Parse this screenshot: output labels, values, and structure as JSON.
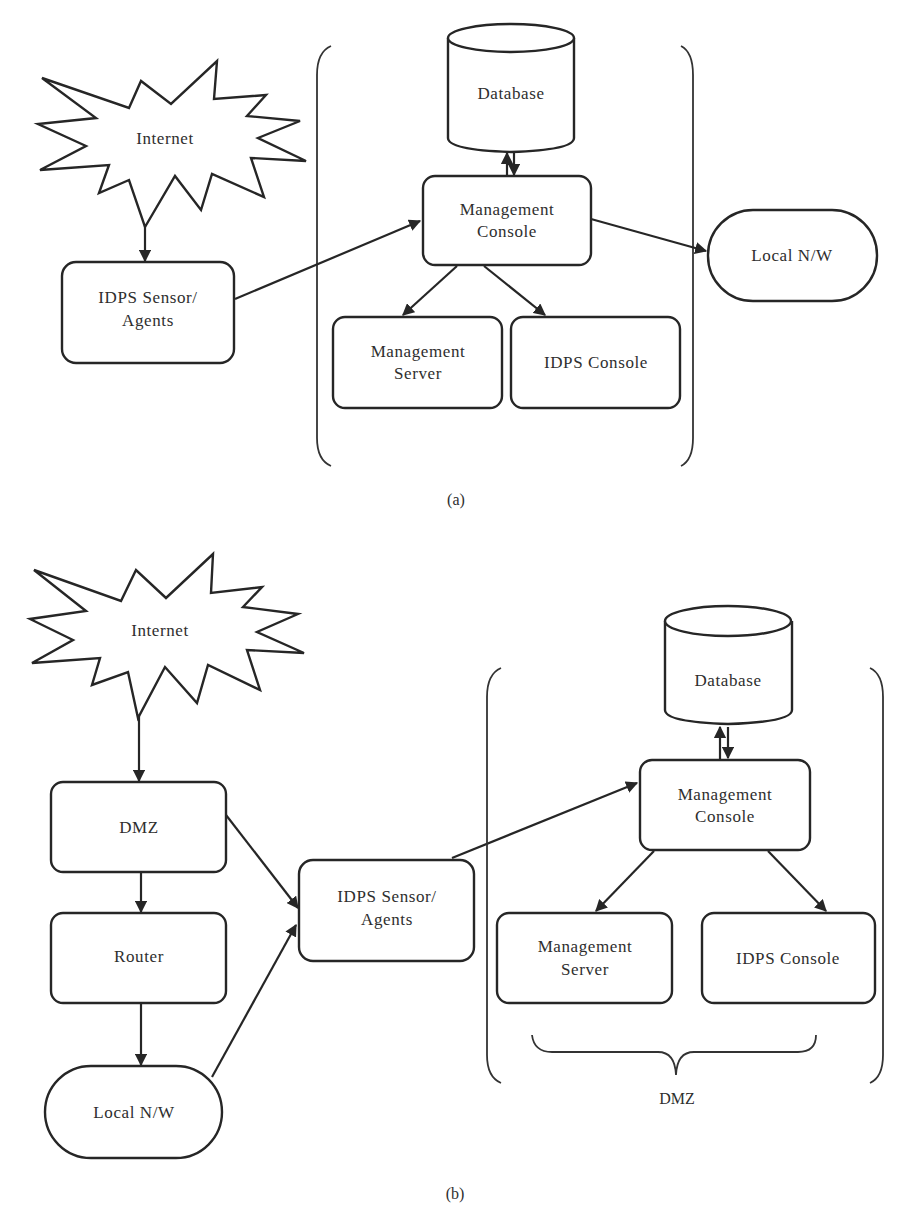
{
  "panels": {
    "a": {
      "caption": "(a)",
      "nodes": {
        "internet": "Internet",
        "sensor_line1": "IDPS Sensor/",
        "sensor_line2": "Agents",
        "database": "Database",
        "mgmt_console_line1": "Management",
        "mgmt_console_line2": "Console",
        "local_nw": "Local N/W",
        "mgmt_server_line1": "Management",
        "mgmt_server_line2": "Server",
        "idps_console": "IDPS Console"
      },
      "edges": [
        {
          "from": "Internet",
          "to": "IDPS Sensor/Agents"
        },
        {
          "from": "IDPS Sensor/Agents",
          "to": "Management Console"
        },
        {
          "from": "Management Console",
          "to": "Database",
          "bidirectional": true
        },
        {
          "from": "Management Console",
          "to": "Local N/W"
        },
        {
          "from": "Management Console",
          "to": "Management Server"
        },
        {
          "from": "Management Console",
          "to": "IDPS Console"
        }
      ]
    },
    "b": {
      "caption": "(b)",
      "group_label": "DMZ",
      "nodes": {
        "internet": "Internet",
        "dmz": "DMZ",
        "router": "Router",
        "local_nw": "Local N/W",
        "sensor_line1": "IDPS Sensor/",
        "sensor_line2": "Agents",
        "database": "Database",
        "mgmt_console_line1": "Management",
        "mgmt_console_line2": "Console",
        "mgmt_server_line1": "Management",
        "mgmt_server_line2": "Server",
        "idps_console": "IDPS Console"
      },
      "edges": [
        {
          "from": "Internet",
          "to": "DMZ"
        },
        {
          "from": "DMZ",
          "to": "Router"
        },
        {
          "from": "Router",
          "to": "Local N/W"
        },
        {
          "from": "DMZ",
          "to": "IDPS Sensor/Agents"
        },
        {
          "from": "Local N/W",
          "to": "IDPS Sensor/Agents"
        },
        {
          "from": "IDPS Sensor/Agents",
          "to": "Management Console"
        },
        {
          "from": "Management Console",
          "to": "Database",
          "bidirectional": true
        },
        {
          "from": "Management Console",
          "to": "Management Server"
        },
        {
          "from": "Management Console",
          "to": "IDPS Console"
        }
      ]
    }
  },
  "colors": {
    "stroke": "#262626",
    "text": "#2e2e2e",
    "background": "#ffffff"
  }
}
